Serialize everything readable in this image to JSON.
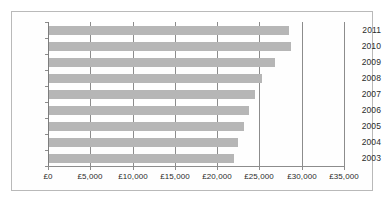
{
  "chart_data": {
    "type": "bar",
    "orientation": "horizontal",
    "title": "",
    "subtitle": "",
    "xlabel": "",
    "ylabel": "",
    "categories": [
      "2011",
      "2010",
      "2009",
      "2008",
      "2007",
      "2006",
      "2005",
      "2004",
      "2003"
    ],
    "values": [
      28400,
      28600,
      26700,
      25200,
      24300,
      23600,
      23000,
      22400,
      21900
    ],
    "series": [
      {
        "name": "",
        "values": [
          28400,
          28600,
          26700,
          25200,
          24300,
          23600,
          23000,
          22400,
          21900
        ]
      }
    ],
    "xlim": [
      0,
      35000
    ],
    "x_tick_values": [
      0,
      5000,
      10000,
      15000,
      20000,
      25000,
      30000,
      35000
    ],
    "x_tick_labels": [
      "£0",
      "£5,000",
      "£10,000",
      "£15,000",
      "£20,000",
      "£25,000",
      "£30,000",
      "£35,000"
    ],
    "y_tick_labels": [
      "2011",
      "2010",
      "2009",
      "2008",
      "2007",
      "2006",
      "2005",
      "2004",
      "2003"
    ],
    "currency_symbol": "£",
    "grid": true,
    "grid_axis": "x",
    "legend": false,
    "legend_position": "none",
    "bar_color": "#b6b6b6",
    "axis_color": "#8c8c8c",
    "text_color": "#2b2b2b",
    "background_color": "#ffffff"
  }
}
